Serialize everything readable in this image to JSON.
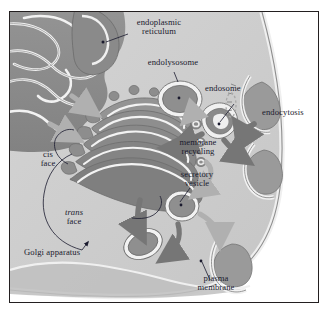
{
  "figure": {
    "type": "biology-diagram",
    "caption": "",
    "colors": {
      "cytoplasm": "#cfcfcf",
      "cytoplasm_light": "#d9d9d9",
      "organelle_dark": "#8d8d8d",
      "organelle_mid": "#a6a6a6",
      "membrane_white": "#f4f4f4",
      "arrow_light": "#b3b3b3",
      "arrow_dark": "#7a7a7a",
      "outline": "#4a4a4a",
      "frame": "#231f20",
      "label_text": "#1a1a2e",
      "exterior": "#ffffff"
    }
  },
  "labels": {
    "endoplasmic_reticulum": "endoplasmic\nreticulum",
    "endolysosome": "endolysosome",
    "endosome": "endosome",
    "endocytosis": "endocytosis",
    "membrane_recycling": "membrane\nrecycling",
    "secretory_vesicle": "secretory\nvesicle",
    "cis_face": "cis\nface",
    "trans_face_italic": "trans",
    "trans_face_rest": "face",
    "golgi_apparatus": "Golgi apparatus",
    "plasma_membrane": "plasma\nmembrane"
  },
  "structures": {
    "er": "endoplasmic reticulum",
    "golgi": "Golgi apparatus",
    "endosome": "endosome",
    "endolysosome": "endolysosome",
    "secretory_vesicle": "secretory vesicle",
    "transport_vesicle": "transport vesicle",
    "coated_pit": "clathrin coated pit",
    "plasma_membrane": "plasma membrane"
  }
}
